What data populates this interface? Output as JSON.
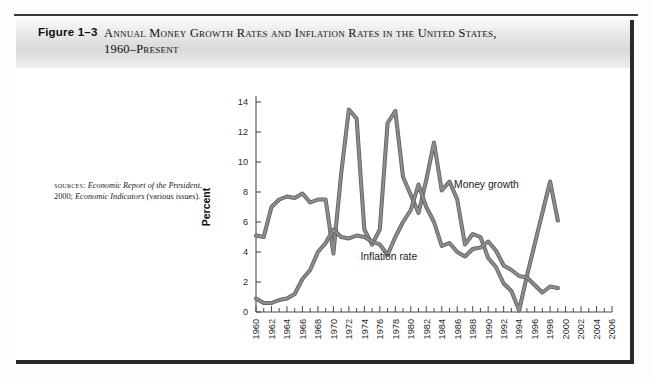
{
  "figure": {
    "number": "Figure 1–3",
    "title_line1": "Annual Money Growth Rates and Inflation Rates in the United States,",
    "title_line2": "1960–Present"
  },
  "sources": {
    "label": "sources:",
    "text_1": "Economic Report of the",
    "text_2": "President",
    "text_3": ", 2000; ",
    "text_4": "Economic",
    "text_5": "Indicators",
    "text_6": " (various issues)."
  },
  "chart_data": {
    "type": "line",
    "xlabel": "Year",
    "ylabel": "Percent",
    "xlim": [
      1960,
      2006
    ],
    "ylim": [
      0,
      14
    ],
    "yticks": [
      0,
      2,
      4,
      6,
      8,
      10,
      12,
      14
    ],
    "xticks": [
      1960,
      1962,
      1964,
      1966,
      1968,
      1970,
      1972,
      1974,
      1976,
      1978,
      1980,
      1982,
      1984,
      1986,
      1988,
      1990,
      1992,
      1994,
      1996,
      1998,
      2000,
      2002,
      2004,
      2006
    ],
    "minor_xticks_every": 1,
    "grid": false,
    "legend_position": "inline-annotation",
    "line_color": "#8c8c8c",
    "line_outline_color": "#5f5f5f",
    "series": [
      {
        "name": "Money growth",
        "label": "Money growth",
        "label_x": 1985.6,
        "label_y": 8.3,
        "x": [
          1960,
          1961,
          1962,
          1963,
          1964,
          1965,
          1966,
          1967,
          1968,
          1969,
          1970,
          1971,
          1972,
          1973,
          1974,
          1975,
          1976,
          1977,
          1978,
          1979,
          1980,
          1981,
          1982,
          1983,
          1984,
          1985,
          1986,
          1987,
          1988,
          1989,
          1990,
          1991,
          1992,
          1993,
          1994,
          1995,
          1996,
          1997,
          1998,
          1999
        ],
        "values": [
          5.1,
          5.0,
          7.0,
          7.5,
          7.7,
          7.6,
          7.9,
          7.3,
          7.5,
          7.5,
          3.9,
          9.2,
          13.5,
          12.9,
          5.5,
          4.5,
          5.5,
          12.6,
          13.4,
          9.0,
          7.8,
          6.6,
          8.8,
          11.3,
          8.1,
          8.7,
          7.5,
          4.5,
          5.2,
          5.0,
          3.6,
          3.0,
          1.9,
          1.4,
          0.1,
          2.4,
          4.5,
          6.6,
          8.7,
          6.1
        ]
      },
      {
        "name": "Inflation rate",
        "label": "Inflation rate",
        "label_x": 1973.5,
        "label_y": 3.5,
        "x": [
          1960,
          1961,
          1962,
          1963,
          1964,
          1965,
          1966,
          1967,
          1968,
          1969,
          1970,
          1971,
          1972,
          1973,
          1974,
          1975,
          1976,
          1977,
          1978,
          1979,
          1980,
          1981,
          1982,
          1983,
          1984,
          1985,
          1986,
          1987,
          1988,
          1989,
          1990,
          1991,
          1992,
          1993,
          1994,
          1995,
          1996,
          1997,
          1998,
          1999
        ],
        "values": [
          0.9,
          0.6,
          0.6,
          0.8,
          0.9,
          1.2,
          2.2,
          2.8,
          4.0,
          4.6,
          5.5,
          5.0,
          4.9,
          5.1,
          5.0,
          4.7,
          4.5,
          3.8,
          5.0,
          6.0,
          6.8,
          8.5,
          7.0,
          6.0,
          4.4,
          4.6,
          4.0,
          3.7,
          4.2,
          4.3,
          4.7,
          4.1,
          3.1,
          2.8,
          2.4,
          2.3,
          1.8,
          1.3,
          1.7,
          1.6
        ]
      }
    ]
  }
}
